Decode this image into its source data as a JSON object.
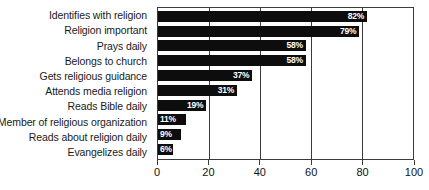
{
  "chart_data": {
    "type": "bar",
    "orientation": "horizontal",
    "title": "",
    "subtitle": "",
    "xlabel": "",
    "ylabel": "",
    "xlim": [
      0,
      100
    ],
    "xticks": [
      0,
      20,
      40,
      60,
      80,
      100
    ],
    "tick_labels": [
      "0",
      "20",
      "40",
      "60",
      "80",
      "100"
    ],
    "grid": "vertical",
    "legend": "none",
    "bar_color": "#0d0d0d",
    "value_label_color": "#ffffff",
    "axis_color": "#3b3b3b",
    "categories": [
      "Identifies with religion",
      "Religion important",
      "Prays daily",
      "Belongs to church",
      "Gets religious guidance",
      "Attends media religion",
      "Reads Bible daily",
      "Member of religious organization",
      "Reads about religion daily",
      "Evangelizes daily"
    ],
    "values": [
      82,
      79,
      58,
      58,
      37,
      31,
      19,
      11,
      9,
      6
    ],
    "value_labels": [
      "82%",
      "79%",
      "58%",
      "58%",
      "37%",
      "31%",
      "19%",
      "11%",
      "9%",
      "6%"
    ]
  }
}
